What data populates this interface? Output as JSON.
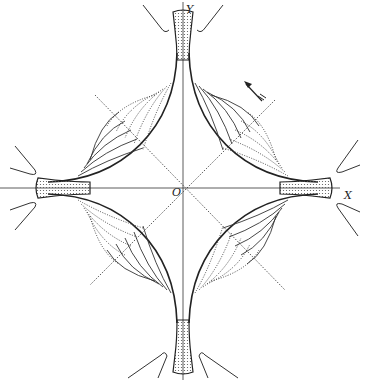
{
  "labels": {
    "y_axis": "Y",
    "x_axis": "X",
    "origin": "O"
  },
  "figure": {
    "contour_count_per_quadrant_side": 5,
    "arrow": "direction-arrow",
    "ink_color": "#222222",
    "stipple_color": "#555555"
  }
}
